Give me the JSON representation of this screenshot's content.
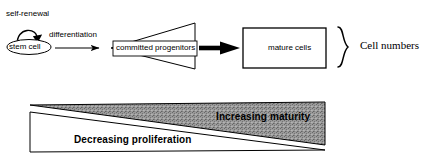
{
  "figure": {
    "background_color": "#ffffff",
    "stroke_color": "#000000",
    "gray_fill": "#8c8c8c"
  },
  "flow": {
    "self_renewal_label": "self-renewal",
    "stem_cell_label": "stem cell",
    "differentiation_label": "differentiation",
    "committed_progenitors_label": "committed progenitors",
    "mature_cells_label": "mature cells",
    "cell_numbers_label": "Cell numbers"
  },
  "gradients": {
    "increasing_maturity_label": "Increasing maturity",
    "decreasing_proliferation_label": "Decreasing proliferation"
  }
}
